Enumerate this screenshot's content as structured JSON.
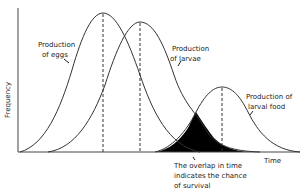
{
  "diagram": {
    "type": "bell-curve-overlap",
    "axes": {
      "ylabel": "Frequency",
      "xlabel": "Time"
    },
    "curves": [
      {
        "name": "eggs",
        "label_lines": [
          "Production",
          "of eggs"
        ],
        "peak_x": 103,
        "peak_y": 13
      },
      {
        "name": "larvae",
        "label_lines": [
          "Production",
          "of larvae"
        ],
        "peak_x": 140,
        "peak_y": 22
      },
      {
        "name": "larval-food",
        "label_lines": [
          "Production of",
          "larval food"
        ],
        "peak_x": 222,
        "peak_y": 87
      }
    ],
    "annotation": {
      "lines": [
        "The overlap in time",
        "indicates the chance",
        "of survival"
      ]
    },
    "colors": {
      "line": "#333333",
      "fill": "#000000",
      "background": "#ffffff"
    }
  }
}
